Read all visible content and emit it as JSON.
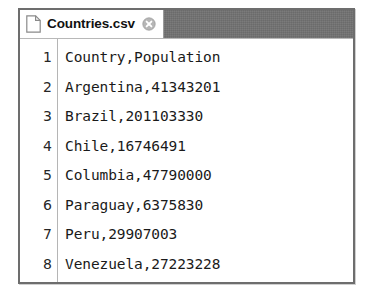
{
  "window": {
    "name": "text-editor-window"
  },
  "tabbar": {
    "active_tab": {
      "title": "Countries.csv",
      "file_icon": "document-icon",
      "close_icon": "close-circle-icon"
    }
  },
  "editor": {
    "lines": [
      {
        "number": "1",
        "text": "Country,Population"
      },
      {
        "number": "2",
        "text": "Argentina,41343201"
      },
      {
        "number": "3",
        "text": "Brazil,201103330"
      },
      {
        "number": "4",
        "text": "Chile,16746491"
      },
      {
        "number": "5",
        "text": "Columbia,47790000"
      },
      {
        "number": "6",
        "text": "Paraguay,6375830"
      },
      {
        "number": "7",
        "text": "Peru,29907003"
      },
      {
        "number": "8",
        "text": "Venezuela,27223228"
      }
    ]
  },
  "colors": {
    "tabbar_inactive": "#6b6b6b",
    "window_border": "#6d6d6d",
    "text": "#1a1a1a",
    "gutter_text": "#262626"
  }
}
